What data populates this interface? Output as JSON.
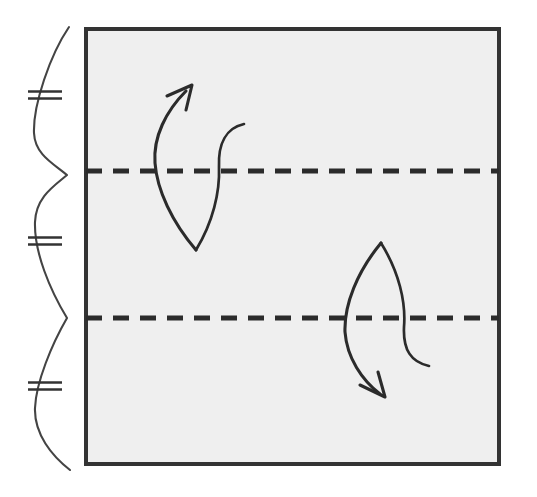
{
  "figure": {
    "type": "origami-fold-step",
    "background_color": "#ffffff",
    "canvas": {
      "width": 537,
      "height": 497
    }
  },
  "paper": {
    "name": "square sheet",
    "shape": "square",
    "fill_color": "#efefef",
    "edge_color": "#333333",
    "edge_width": 4,
    "x": 86,
    "y": 29,
    "width": 413,
    "height": 435
  },
  "fold_lines": [
    {
      "label": "upper fold line",
      "style": "dashed",
      "meaning": "valley fold / crease",
      "color": "#2b2b2b",
      "y": 171,
      "x_start": 86,
      "x_end": 499,
      "dash_length": 16,
      "gap_length": 11
    },
    {
      "label": "lower fold line",
      "style": "dashed",
      "meaning": "valley fold / crease",
      "color": "#2b2b2b",
      "y": 318,
      "x_start": 86,
      "x_end": 499,
      "dash_length": 16,
      "gap_length": 11
    }
  ],
  "brace": {
    "label": "equal-thirds measurement brace",
    "color": "#444444",
    "stroke_width": 2.1,
    "segments": 3,
    "cusp_y_positions": [
      175,
      318
    ],
    "top_y": 27,
    "bottom_y": 470
  },
  "tick_marks": [
    {
      "label": "equality tick top",
      "glyph": "double-hash",
      "lines": 2,
      "x": 45,
      "y": 95
    },
    {
      "label": "equality tick middle",
      "glyph": "double-hash",
      "lines": 2,
      "x": 45,
      "y": 241
    },
    {
      "label": "equality tick bottom",
      "glyph": "double-hash",
      "lines": 2,
      "x": 45,
      "y": 386
    }
  ],
  "arrows": [
    {
      "label": "upper fold-and-unfold arrow",
      "meaning": "fold up along upper crease then unfold",
      "direction": "up-right",
      "color": "#2b2b2b",
      "head_x": 190,
      "head_y": 86
    },
    {
      "label": "lower fold-and-unfold arrow",
      "meaning": "fold down along lower crease then unfold",
      "direction": "down-right",
      "color": "#2b2b2b",
      "head_x": 383,
      "head_y": 396
    }
  ],
  "colors": {
    "paper": "#efefef",
    "ink": "#2b2b2b",
    "edge": "#333333",
    "brace": "#444444",
    "background": "#ffffff"
  }
}
